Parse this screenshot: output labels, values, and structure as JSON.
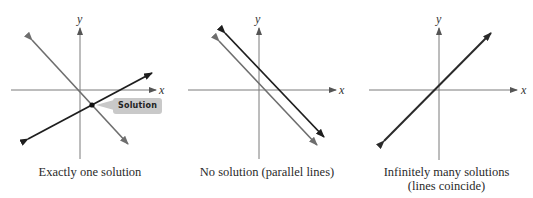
{
  "figure": {
    "panels": [
      {
        "id": "one-solution",
        "caption_lines": [
          "Exactly one solution"
        ],
        "x_label": "x",
        "y_label": "y",
        "callout": "Solution",
        "lines": [
          {
            "name": "line-1",
            "color": "#6e6e6e",
            "from": [
              32,
              40
            ],
            "to": [
              128,
              144
            ]
          },
          {
            "name": "line-2",
            "color": "#1e1e1e",
            "from": [
              28,
              139
            ],
            "to": [
              152,
              73
            ]
          }
        ],
        "intersection": [
          92,
          105
        ]
      },
      {
        "id": "no-solution",
        "caption_lines": [
          "No solution (parallel lines)"
        ],
        "x_label": "x",
        "y_label": "y",
        "lines": [
          {
            "name": "line-1",
            "color": "#1e1e1e",
            "from": [
              225,
              33
            ],
            "to": [
              324,
              137
            ]
          },
          {
            "name": "line-2",
            "color": "#6e6e6e",
            "from": [
              219,
              41
            ],
            "to": [
              317,
              145
            ]
          }
        ]
      },
      {
        "id": "infinite-solutions",
        "caption_lines": [
          "Infinitely many solutions",
          "(lines coincide)"
        ],
        "x_label": "x",
        "y_label": "y",
        "lines": [
          {
            "name": "coincident-lines",
            "color": "#2a2a2a",
            "from": [
              384,
              141
            ],
            "to": [
              491,
              33
            ]
          }
        ]
      }
    ],
    "colors": {
      "axis": "#7a7a7a",
      "dark_line": "#1e1e1e",
      "gray_line": "#6e6e6e",
      "callout_bg": "#c9c9c9"
    }
  }
}
